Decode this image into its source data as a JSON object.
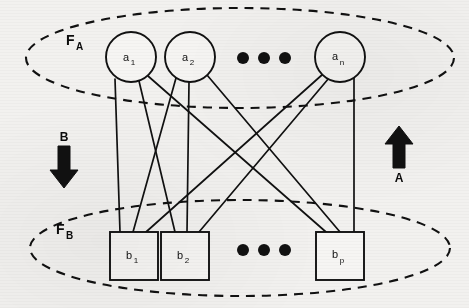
{
  "diagram": {
    "type": "bidirectional-associative-memory",
    "background_color": "#f2f1ef",
    "stroke_color": "#111111",
    "fields": [
      {
        "id": "FA",
        "base_label": "F",
        "subscript": "A",
        "shape": "dashed-ellipse",
        "label_x": 72,
        "label_y": 45,
        "ellipse": {
          "cx": 240,
          "cy": 58,
          "rx": 214,
          "ry": 50
        }
      },
      {
        "id": "FB",
        "base_label": "F",
        "subscript": "B",
        "shape": "dashed-ellipse",
        "label_x": 62,
        "label_y": 234,
        "ellipse": {
          "cx": 240,
          "cy": 248,
          "rx": 210,
          "ry": 48
        }
      }
    ],
    "layer_a": {
      "shape": "circle",
      "radius": 25,
      "nodes": [
        {
          "id": "a1",
          "base_label": "a",
          "subscript": "1",
          "cx": 131,
          "cy": 57
        },
        {
          "id": "a2",
          "base_label": "a",
          "subscript": "2",
          "cx": 190,
          "cy": 57
        },
        {
          "id": "an",
          "base_label": "a",
          "subscript": "n",
          "cx": 340,
          "cy": 57
        }
      ],
      "ellipsis": {
        "label": "...",
        "dots": [
          {
            "cx": 243,
            "cy": 58,
            "r": 6
          },
          {
            "cx": 264,
            "cy": 58,
            "r": 6
          },
          {
            "cx": 285,
            "cy": 58,
            "r": 6
          }
        ]
      }
    },
    "layer_b": {
      "shape": "square",
      "size": 48,
      "nodes": [
        {
          "id": "b1",
          "base_label": "b",
          "subscript": "1",
          "x": 110,
          "y": 232
        },
        {
          "id": "b2",
          "base_label": "b",
          "subscript": "2",
          "x": 161,
          "y": 232
        },
        {
          "id": "bp",
          "base_label": "b",
          "subscript": "p",
          "x": 316,
          "y": 232
        }
      ],
      "ellipsis": {
        "label": "...",
        "dots": [
          {
            "cx": 243,
            "cy": 250,
            "r": 6
          },
          {
            "cx": 264,
            "cy": 250,
            "r": 6
          },
          {
            "cx": 285,
            "cy": 250,
            "r": 6
          }
        ]
      }
    },
    "connections": [
      {
        "from": "a1",
        "to": "b1",
        "x1": 115,
        "y1": 79,
        "x2": 120,
        "y2": 232
      },
      {
        "from": "a1",
        "to": "b2",
        "x1": 139,
        "y1": 81,
        "x2": 175,
        "y2": 232
      },
      {
        "from": "a1",
        "to": "bp",
        "x1": 148,
        "y1": 76,
        "x2": 326,
        "y2": 232
      },
      {
        "from": "a2",
        "to": "b1",
        "x1": 176,
        "y1": 78,
        "x2": 133,
        "y2": 232
      },
      {
        "from": "a2",
        "to": "b2",
        "x1": 189,
        "y1": 82,
        "x2": 187,
        "y2": 232
      },
      {
        "from": "a2",
        "to": "bp",
        "x1": 207,
        "y1": 75,
        "x2": 340,
        "y2": 232
      },
      {
        "from": "an",
        "to": "b1",
        "x1": 323,
        "y1": 74,
        "x2": 146,
        "y2": 232
      },
      {
        "from": "an",
        "to": "b2",
        "x1": 329,
        "y1": 78,
        "x2": 199,
        "y2": 232
      },
      {
        "from": "an",
        "to": "bp",
        "x1": 354,
        "y1": 76,
        "x2": 354,
        "y2": 232
      }
    ],
    "arrows": [
      {
        "id": "B",
        "label": "B",
        "direction": "down",
        "label_x": 66,
        "label_y": 143,
        "x": 64,
        "y_top": 148,
        "y_bottom": 185
      },
      {
        "id": "A",
        "label": "A",
        "direction": "up",
        "label_x": 401,
        "label_y": 182,
        "x": 399,
        "y_top": 128,
        "y_bottom": 168
      }
    ]
  }
}
